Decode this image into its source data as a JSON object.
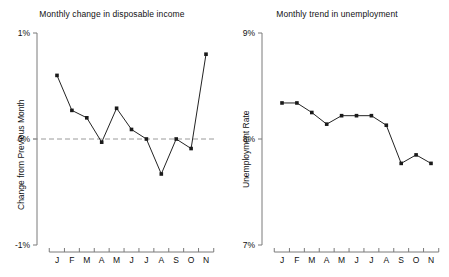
{
  "chart_data": [
    {
      "type": "line",
      "panel": "left",
      "title": "Monthly change in disposable income",
      "xlabel": "",
      "ylabel": "Change from Previous Month",
      "categories": [
        "J",
        "F",
        "M",
        "A",
        "M",
        "J",
        "J",
        "A",
        "S",
        "O",
        "N"
      ],
      "values": [
        0.6,
        0.27,
        0.2,
        -0.03,
        0.29,
        0.09,
        0.0,
        -0.33,
        0.0,
        -0.09,
        0.8
      ],
      "ylim": [
        -1,
        1
      ],
      "yticks": [
        1,
        0,
        -1
      ],
      "ytick_labels": [
        "1%",
        "0%",
        "-1%"
      ],
      "grid": false,
      "legend": "none",
      "reference_line": {
        "value": 0,
        "style": "dashed"
      }
    },
    {
      "type": "line",
      "panel": "right",
      "title": "Monthly trend in unemployment",
      "xlabel": "",
      "ylabel": "Unemployment Rate",
      "categories": [
        "J",
        "F",
        "M",
        "A",
        "M",
        "J",
        "J",
        "A",
        "S",
        "O",
        "N"
      ],
      "values": [
        8.34,
        8.34,
        8.25,
        8.14,
        8.22,
        8.22,
        8.22,
        8.13,
        7.77,
        7.85,
        7.77
      ],
      "ylim": [
        7,
        9
      ],
      "yticks": [
        9,
        8,
        7
      ],
      "ytick_labels": [
        "9%",
        "8%",
        "7%"
      ],
      "grid": false,
      "legend": "none"
    }
  ],
  "colors": {
    "line": "#232323",
    "marker": "#1a1a1a",
    "axis": "#7a7a7a",
    "reference": "#9a9a9a",
    "background": "#ffffff"
  }
}
